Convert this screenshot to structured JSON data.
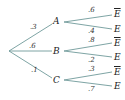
{
  "diagram": {
    "type": "probability-tree",
    "line_color": "#6f9a9a",
    "root": {
      "label": ""
    },
    "branches": [
      {
        "node": "A",
        "prob": ".3",
        "children": [
          {
            "label": "E",
            "bar": true,
            "prob": ".6"
          },
          {
            "label": "E",
            "bar": false,
            "prob": ".4"
          }
        ]
      },
      {
        "node": "B",
        "prob": ".6",
        "children": [
          {
            "label": "E",
            "bar": true,
            "prob": ".8"
          },
          {
            "label": "E",
            "bar": false,
            "prob": ".2"
          }
        ]
      },
      {
        "node": "C",
        "prob": ".1",
        "children": [
          {
            "label": "E",
            "bar": true,
            "prob": ".3"
          },
          {
            "label": "E",
            "bar": false,
            "prob": ".7"
          }
        ]
      }
    ]
  }
}
